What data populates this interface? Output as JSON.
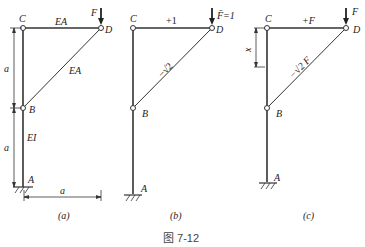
{
  "figure": {
    "caption": "图 7-12",
    "panels": [
      {
        "id": "a",
        "caption": "(a)",
        "nodes": {
          "C": "C",
          "D": "D",
          "B": "B",
          "A": "A"
        },
        "load": "F",
        "members": {
          "CD": "EA",
          "BD": "EA",
          "AB": "EI"
        },
        "dims": {
          "upper": "a",
          "lower": "a",
          "horizontal": "a"
        }
      },
      {
        "id": "b",
        "caption": "(b)",
        "nodes": {
          "C": "C",
          "D": "D",
          "B": "B",
          "A": "A"
        },
        "load": "F̄=1",
        "members": {
          "CD": "+1",
          "BD": "−√2"
        }
      },
      {
        "id": "c",
        "caption": "(c)",
        "nodes": {
          "C": "C",
          "D": "D",
          "B": "B",
          "A": "A"
        },
        "load": "F",
        "members": {
          "CD": "+F",
          "BD": "−√2 F"
        },
        "dims": {
          "x": "x"
        }
      }
    ]
  }
}
